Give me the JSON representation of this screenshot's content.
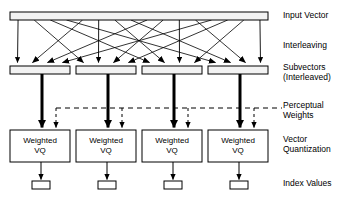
{
  "figure": {
    "type": "block-flow-diagram",
    "background_color": "#ffffff",
    "line_color": "#000000",
    "bar_fill": "#f2f2f2"
  },
  "stage_labels": [
    {
      "id": "input-vector",
      "text": "Input Vector",
      "x": 283,
      "y": 10
    },
    {
      "id": "interleaving",
      "text": "Interleaving",
      "x": 283,
      "y": 40
    },
    {
      "id": "subvectors",
      "text": "Subvectors\n(Interleaved)",
      "x": 283,
      "y": 64
    },
    {
      "id": "perceptual",
      "text": "Perceptual\nWeights",
      "x": 283,
      "y": 100
    },
    {
      "id": "quantization",
      "text": "Vector\nQuantization",
      "x": 283,
      "y": 135
    },
    {
      "id": "index-values",
      "text": "Index Values",
      "x": 283,
      "y": 178
    }
  ],
  "input_vector": {
    "label": "Input Vector",
    "x": 10,
    "y": 12,
    "width": 258,
    "height": 8
  },
  "subvector_bars": [
    {
      "label": "Subvector 1",
      "x": 10,
      "y": 66,
      "width": 60,
      "height": 8
    },
    {
      "label": "Subvector 2",
      "x": 76,
      "y": 66,
      "width": 60,
      "height": 8
    },
    {
      "label": "Subvector 3",
      "x": 142,
      "y": 66,
      "width": 60,
      "height": 8
    },
    {
      "label": "Subvector 4",
      "x": 208,
      "y": 66,
      "width": 60,
      "height": 8
    }
  ],
  "vq_blocks": [
    {
      "line1": "Weighted",
      "line2": "VQ",
      "x": 10,
      "y": 130,
      "width": 60,
      "height": 32
    },
    {
      "line1": "Weighted",
      "line2": "VQ",
      "x": 76,
      "y": 130,
      "width": 60,
      "height": 32
    },
    {
      "line1": "Weighted",
      "line2": "VQ",
      "x": 142,
      "y": 130,
      "width": 60,
      "height": 32
    },
    {
      "line1": "Weighted",
      "line2": "VQ",
      "x": 208,
      "y": 130,
      "width": 60,
      "height": 32
    }
  ],
  "index_boxes": [
    {
      "label": "Index 1",
      "x": 32,
      "y": 181,
      "width": 18,
      "height": 8
    },
    {
      "label": "Index 2",
      "x": 98,
      "y": 181,
      "width": 18,
      "height": 8
    },
    {
      "label": "Index 3",
      "x": 164,
      "y": 181,
      "width": 18,
      "height": 8
    },
    {
      "label": "Index 4",
      "x": 230,
      "y": 181,
      "width": 18,
      "height": 8
    }
  ],
  "thick_arrows": [
    {
      "label": "subvector-to-vq-1",
      "x": 42
    },
    {
      "label": "subvector-to-vq-2",
      "x": 108
    },
    {
      "label": "subvector-to-vq-3",
      "x": 174
    },
    {
      "label": "subvector-to-vq-4",
      "x": 240
    }
  ],
  "perceptual_weight_line": {
    "label": "Perceptual Weights bus",
    "y": 108,
    "x_start": 56,
    "x_end": 282,
    "dash": "5 4",
    "drops": [
      56,
      122,
      188,
      254
    ]
  },
  "interleaving": {
    "description": "Samples of the input vector are permuted and distributed across four subvectors",
    "source_count": 16,
    "target_count": 16,
    "source_y": 20,
    "target_y": 64,
    "permutation": [
      0,
      4,
      8,
      12,
      1,
      5,
      9,
      13,
      2,
      6,
      10,
      14,
      3,
      7,
      11,
      15
    ]
  }
}
